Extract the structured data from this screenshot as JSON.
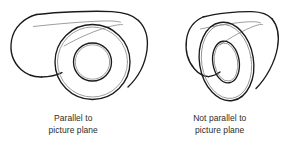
{
  "figure": {
    "background_color": "#ffffff",
    "outline_color": "#1a1a1a",
    "inner_line_color": "#8c8c8c",
    "text_color": "#2b2b2b"
  },
  "panels": [
    {
      "id": "parallel",
      "caption_line1": "Parallel to",
      "caption_line2": "picture plane",
      "subject": "cylindrical-tube-circular-face",
      "face_shape": "circle"
    },
    {
      "id": "not-parallel",
      "caption_line1": "Not parallel to",
      "caption_line2": "picture plane",
      "subject": "cylindrical-tube-elliptical-face",
      "face_shape": "ellipse"
    }
  ]
}
